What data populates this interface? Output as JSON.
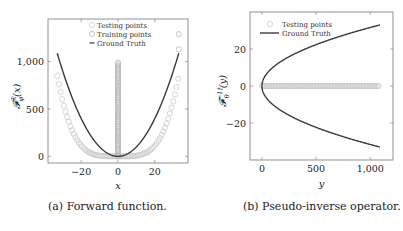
{
  "chart_data": [
    {
      "type": "scatter",
      "id": "forward",
      "caption": "(a) Forward function.",
      "xlabel": "x",
      "ylabel": "𝓕^ℛ_φ(x)",
      "xlim": [
        -38,
        38
      ],
      "ylim": [
        -70,
        1450
      ],
      "xticks": [
        -20,
        0,
        20
      ],
      "xtick_labels": [
        "−20",
        "0",
        "20"
      ],
      "yticks": [
        0,
        500,
        1000
      ],
      "ytick_labels": [
        "0",
        "500",
        "1,000"
      ],
      "grid": false,
      "legend_position": "top-center",
      "legend": [
        "Testing points",
        "Training points",
        "Ground Truth"
      ],
      "series": [
        {
          "name": "Testing points",
          "kind": "marker-quartic",
          "x_range": [
            -33,
            33
          ],
          "y_at_x33": 850,
          "description": "Flat near 0 for |x|<15, rising steeply to ~850 at |x|=33"
        },
        {
          "name": "Training points",
          "kind": "marker-vertical",
          "x": 0,
          "y_range": [
            0,
            1000
          ],
          "extra_points": [
            [
              33,
              1290
            ],
            [
              33,
              1130
            ]
          ]
        },
        {
          "name": "Ground Truth",
          "kind": "line",
          "function": "x^2",
          "x_range": [
            -33,
            33
          ]
        }
      ],
      "colors": {
        "ground_truth": "#3a3a3a",
        "testing": "#c4c4c4",
        "training": "#b0b0b0"
      }
    },
    {
      "type": "scatter",
      "id": "pseudo-inverse",
      "caption": "(b) Pseudo-inverse operator.",
      "xlabel": "y",
      "ylabel": "𝓕^{-1†}_θ(y)",
      "xlim": [
        -110,
        1210
      ],
      "ylim": [
        -40,
        40
      ],
      "xticks": [
        0,
        500,
        1000
      ],
      "xtick_labels": [
        "0",
        "500",
        "1,000"
      ],
      "yticks": [
        -20,
        0,
        20
      ],
      "ytick_labels": [
        "−20",
        "0",
        "20"
      ],
      "grid": false,
      "legend_position": "top-left",
      "legend": [
        "Testing points",
        "Ground Truth"
      ],
      "series": [
        {
          "name": "Testing points",
          "kind": "marker-horizontal",
          "y": 0,
          "x_range": [
            0,
            1090
          ]
        },
        {
          "name": "Ground Truth",
          "kind": "line",
          "function": "±sqrt(y)",
          "x_range": [
            0,
            1090
          ]
        }
      ],
      "colors": {
        "ground_truth": "#3a3a3a",
        "testing": "#c4c4c4"
      }
    }
  ]
}
